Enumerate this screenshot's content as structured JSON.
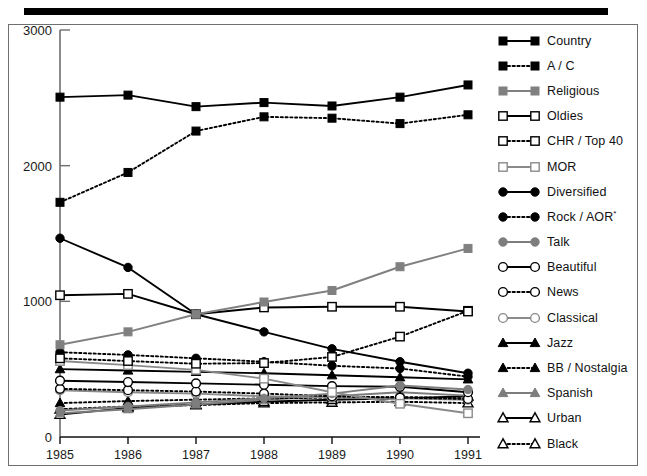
{
  "figure": {
    "top_rule": true,
    "frame": true
  },
  "chart_data": {
    "type": "line",
    "title": "",
    "xlabel": "",
    "ylabel": "",
    "x": [
      1985,
      1986,
      1987,
      1988,
      1989,
      1990,
      1991
    ],
    "xtick_labels": [
      "1985",
      "1986",
      "1987",
      "1988",
      "1989",
      "1990",
      "1991"
    ],
    "ytick_labels": [
      "0",
      "1000",
      "2000",
      "3000"
    ],
    "yticks": [
      0,
      1000,
      2000,
      3000
    ],
    "ylim": [
      0,
      3000
    ],
    "grid": false,
    "legend_position": "right",
    "series": [
      {
        "name": "Country",
        "values": [
          2505,
          2520,
          2435,
          2465,
          2440,
          2505,
          2595
        ],
        "marker": "square-filled",
        "dash": "solid",
        "color": "#000000"
      },
      {
        "name": "A / C",
        "values": [
          1730,
          1950,
          2255,
          2360,
          2350,
          2310,
          2375
        ],
        "marker": "square-filled",
        "dash": "dotted",
        "color": "#000000"
      },
      {
        "name": "Religious",
        "values": [
          680,
          775,
          905,
          995,
          1080,
          1255,
          1390
        ],
        "marker": "square-filled",
        "dash": "solid",
        "color": "#808080"
      },
      {
        "name": "Oldies",
        "values": [
          1045,
          1055,
          905,
          955,
          960,
          960,
          925
        ],
        "marker": "square-open",
        "dash": "solid",
        "color": "#000000"
      },
      {
        "name": "CHR / Top 40",
        "values": [
          580,
          560,
          540,
          545,
          590,
          740,
          930
        ],
        "marker": "square-open",
        "dash": "dotted",
        "color": "#000000"
      },
      {
        "name": "MOR",
        "values": [
          560,
          530,
          495,
          430,
          330,
          245,
          175
        ],
        "marker": "square-open",
        "dash": "solid",
        "color": "#8a8a8a"
      },
      {
        "name": "Diversified",
        "values": [
          1465,
          1250,
          905,
          775,
          650,
          555,
          470
        ],
        "marker": "circle-filled",
        "dash": "solid",
        "color": "#000000"
      },
      {
        "name": "Rock / AOR*",
        "values": [
          625,
          605,
          580,
          555,
          525,
          505,
          445
        ],
        "marker": "circle-filled",
        "dash": "dotted",
        "color": "#000000"
      },
      {
        "name": "Talk",
        "values": [
          195,
          225,
          255,
          285,
          320,
          380,
          350
        ],
        "marker": "circle-filled",
        "dash": "solid",
        "color": "#7d7d7d"
      },
      {
        "name": "Beautiful",
        "values": [
          415,
          405,
          395,
          385,
          375,
          370,
          330
        ],
        "marker": "circle-open",
        "dash": "solid",
        "color": "#000000"
      },
      {
        "name": "News",
        "values": [
          355,
          345,
          335,
          320,
          300,
          290,
          280
        ],
        "marker": "circle-open",
        "dash": "dotted",
        "color": "#000000"
      },
      {
        "name": "Classical",
        "values": [
          345,
          330,
          320,
          300,
          290,
          285,
          275
        ],
        "marker": "circle-open",
        "dash": "solid",
        "color": "#8a8a8a"
      },
      {
        "name": "Jazz",
        "values": [
          500,
          490,
          480,
          470,
          455,
          440,
          425
        ],
        "marker": "triangle-filled",
        "dash": "solid",
        "color": "#000000"
      },
      {
        "name": "BB / Nostalgia",
        "values": [
          250,
          265,
          275,
          285,
          290,
          295,
          285
        ],
        "marker": "triangle-filled",
        "dash": "dotted",
        "color": "#000000"
      },
      {
        "name": "Spanish",
        "values": [
          175,
          205,
          240,
          275,
          300,
          330,
          305
        ],
        "marker": "triangle-filled",
        "dash": "solid",
        "color": "#7d7d7d"
      },
      {
        "name": "Urban",
        "values": [
          165,
          215,
          240,
          260,
          275,
          285,
          300
        ],
        "marker": "triangle-open",
        "dash": "solid",
        "color": "#000000"
      },
      {
        "name": "Black",
        "values": [
          205,
          225,
          235,
          250,
          255,
          260,
          250
        ],
        "marker": "triangle-open",
        "dash": "dotted",
        "color": "#000000"
      }
    ]
  },
  "legend": {
    "items": [
      {
        "label": "Country"
      },
      {
        "label": "A / C"
      },
      {
        "label": "Religious"
      },
      {
        "label": "Oldies"
      },
      {
        "label": "CHR / Top 40"
      },
      {
        "label": "MOR"
      },
      {
        "label": "Diversified"
      },
      {
        "label": "Rock / AOR",
        "sup": "*"
      },
      {
        "label": "Talk"
      },
      {
        "label": "Beautiful"
      },
      {
        "label": "News"
      },
      {
        "label": "Classical"
      },
      {
        "label": "Jazz"
      },
      {
        "label": "BB / Nostalgia"
      },
      {
        "label": "Spanish"
      },
      {
        "label": "Urban"
      },
      {
        "label": "Black"
      }
    ]
  }
}
